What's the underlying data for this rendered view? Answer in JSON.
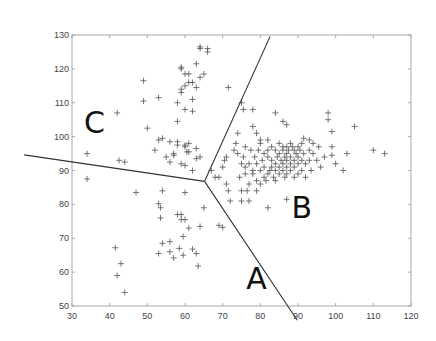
{
  "chart_data": {
    "type": "scatter",
    "title": "",
    "xlabel": "",
    "ylabel": "",
    "xlim": [
      30,
      120
    ],
    "ylim": [
      50,
      130
    ],
    "xticks": [
      30,
      40,
      50,
      60,
      70,
      80,
      90,
      100,
      110,
      120
    ],
    "yticks": [
      50,
      60,
      70,
      80,
      90,
      100,
      110,
      120,
      130
    ],
    "grid": false,
    "marker": "+",
    "marker_color": "#555555",
    "line_color": "#333333",
    "region_labels": [
      {
        "text": "C",
        "x": 36,
        "y": 101
      },
      {
        "text": "B",
        "x": 91,
        "y": 76
      },
      {
        "text": "A",
        "x": 79,
        "y": 55
      }
    ],
    "boundary_lines": {
      "vertex": [
        65.2,
        86.8
      ],
      "endpoints": [
        [
          17.3,
          94.6
        ],
        [
          82.6,
          129.6
        ],
        [
          89.8,
          45.8
        ]
      ]
    },
    "series": [
      {
        "name": "C",
        "points": [
          [
            34,
            95
          ],
          [
            42,
            107
          ],
          [
            42.5,
            93
          ],
          [
            44,
            92.5
          ],
          [
            49,
            116.5
          ],
          [
            49,
            110.5
          ],
          [
            50,
            102.5
          ],
          [
            53,
            111.5
          ],
          [
            53,
            99
          ],
          [
            54,
            99.5
          ],
          [
            52,
            96
          ],
          [
            56,
            98.5
          ],
          [
            57,
            94.5
          ],
          [
            58,
            104.5
          ],
          [
            58,
            110
          ],
          [
            59,
            113
          ],
          [
            59,
            114
          ],
          [
            60,
            115
          ],
          [
            60,
            108
          ],
          [
            59,
            120.5
          ],
          [
            59,
            120
          ],
          [
            60,
            118.5
          ],
          [
            61,
            118.5
          ],
          [
            61,
            116
          ],
          [
            62,
            116
          ],
          [
            62,
            111
          ],
          [
            62,
            107.5
          ],
          [
            63,
            114.5
          ],
          [
            63,
            121.5
          ],
          [
            64,
            117.5
          ],
          [
            65,
            118.5
          ],
          [
            64,
            126.5
          ],
          [
            64,
            126
          ],
          [
            66,
            125
          ],
          [
            66,
            126
          ],
          [
            60,
            97.5
          ],
          [
            60,
            97
          ],
          [
            61,
            98
          ],
          [
            60.5,
            95.5
          ],
          [
            61,
            95.5
          ],
          [
            59,
            92
          ],
          [
            60,
            91.5
          ],
          [
            56,
            92.5
          ],
          [
            55,
            94
          ],
          [
            58,
            97.5
          ],
          [
            58,
            98.5
          ],
          [
            57,
            95
          ],
          [
            63,
            93.5
          ],
          [
            62,
            90
          ],
          [
            64,
            94
          ],
          [
            63,
            96.5
          ]
        ]
      },
      {
        "name": "A",
        "points": [
          [
            34,
            87.5
          ],
          [
            47,
            83.5
          ],
          [
            53,
            80.2
          ],
          [
            53.5,
            79
          ],
          [
            53.5,
            76
          ],
          [
            54,
            84
          ],
          [
            58,
            77
          ],
          [
            59,
            77
          ],
          [
            59,
            75.5
          ],
          [
            60,
            75.5
          ],
          [
            59.5,
            70.5
          ],
          [
            61,
            73
          ],
          [
            60,
            83.5
          ],
          [
            64,
            73.5
          ],
          [
            65,
            79
          ],
          [
            69,
            73.8
          ],
          [
            70,
            73.2
          ],
          [
            41.5,
            67.2
          ],
          [
            43,
            62.5
          ],
          [
            42,
            59
          ],
          [
            44,
            54
          ],
          [
            53,
            65.5
          ],
          [
            54,
            68.5
          ],
          [
            56,
            69
          ],
          [
            56,
            66
          ],
          [
            57,
            64.2
          ],
          [
            58.5,
            67
          ],
          [
            59.5,
            65
          ],
          [
            62,
            66.8
          ],
          [
            63,
            65.5
          ],
          [
            63.5,
            61.8
          ]
        ]
      },
      {
        "name": "B",
        "points": [
          [
            67,
            90
          ],
          [
            68,
            88
          ],
          [
            69,
            88
          ],
          [
            70,
            91
          ],
          [
            70.5,
            93
          ],
          [
            71,
            94
          ],
          [
            71,
            86
          ],
          [
            71.5,
            84
          ],
          [
            72,
            81
          ],
          [
            73,
            96
          ],
          [
            73.5,
            98
          ],
          [
            74,
            101
          ],
          [
            74,
            95
          ],
          [
            74.5,
            88
          ],
          [
            75,
            92
          ],
          [
            75,
            81
          ],
          [
            75,
            84
          ],
          [
            75.5,
            94
          ],
          [
            76,
            97
          ],
          [
            76,
            91
          ],
          [
            76,
            89
          ],
          [
            76.5,
            84
          ],
          [
            77,
            92
          ],
          [
            77,
            86
          ],
          [
            77,
            81
          ],
          [
            77.5,
            96
          ],
          [
            78,
            90
          ],
          [
            78,
            89
          ],
          [
            78.5,
            94
          ],
          [
            79,
            92
          ],
          [
            79,
            87
          ],
          [
            79,
            84
          ],
          [
            79.5,
            96
          ],
          [
            80,
            98
          ],
          [
            80,
            90
          ],
          [
            80,
            86
          ],
          [
            80.5,
            93
          ],
          [
            81,
            95
          ],
          [
            81,
            91
          ],
          [
            81,
            88
          ],
          [
            81.5,
            87
          ],
          [
            82,
            99
          ],
          [
            82,
            96
          ],
          [
            82,
            94
          ],
          [
            82,
            89
          ],
          [
            82,
            79
          ],
          [
            82.5,
            90
          ],
          [
            83,
            97
          ],
          [
            83,
            93
          ],
          [
            83,
            91
          ],
          [
            83.5,
            88
          ],
          [
            84,
            96
          ],
          [
            84,
            92
          ],
          [
            84,
            90
          ],
          [
            84,
            87
          ],
          [
            84.5,
            94
          ],
          [
            85,
            98
          ],
          [
            85,
            95
          ],
          [
            85,
            91
          ],
          [
            85,
            89
          ],
          [
            85.5,
            93
          ],
          [
            86,
            97
          ],
          [
            86,
            96
          ],
          [
            86,
            92
          ],
          [
            86,
            90
          ],
          [
            86.5,
            88
          ],
          [
            86.5,
            94
          ],
          [
            87,
            97
          ],
          [
            87,
            95
          ],
          [
            87,
            93
          ],
          [
            87,
            91
          ],
          [
            87,
            89
          ],
          [
            87,
            81.5
          ],
          [
            87.5,
            96
          ],
          [
            88,
            98
          ],
          [
            88,
            94
          ],
          [
            88,
            92
          ],
          [
            88,
            90
          ],
          [
            88.5,
            97
          ],
          [
            89,
            96
          ],
          [
            89,
            93
          ],
          [
            89,
            91
          ],
          [
            89,
            88
          ],
          [
            89.5,
            95
          ],
          [
            90,
            97
          ],
          [
            90,
            94
          ],
          [
            90,
            92
          ],
          [
            90,
            89
          ],
          [
            90.5,
            96
          ],
          [
            91,
            98
          ],
          [
            91,
            93
          ],
          [
            91,
            90
          ],
          [
            91.5,
            95
          ],
          [
            92,
            92
          ],
          [
            92,
            88
          ],
          [
            93,
            96
          ],
          [
            93,
            93
          ],
          [
            93.5,
            90
          ],
          [
            94,
            98
          ],
          [
            94,
            95
          ],
          [
            95,
            93
          ],
          [
            95.5,
            97
          ],
          [
            96,
            91
          ],
          [
            97,
            94
          ],
          [
            98,
            107
          ],
          [
            98,
            105
          ],
          [
            99,
            101.5
          ],
          [
            99,
            97
          ],
          [
            99,
            94.5
          ],
          [
            100,
            92
          ],
          [
            103,
            95
          ],
          [
            105,
            103
          ],
          [
            102,
            90
          ],
          [
            110,
            96
          ],
          [
            113,
            95
          ],
          [
            80,
            99
          ],
          [
            79,
            101
          ],
          [
            78,
            103
          ],
          [
            84,
            107
          ],
          [
            86,
            104.5
          ],
          [
            87,
            103.5
          ],
          [
            78,
            108
          ],
          [
            75,
            110
          ],
          [
            71.5,
            114.5
          ],
          [
            75.5,
            108
          ],
          [
            91.5,
            99.5
          ],
          [
            93,
            99
          ]
        ]
      }
    ]
  }
}
